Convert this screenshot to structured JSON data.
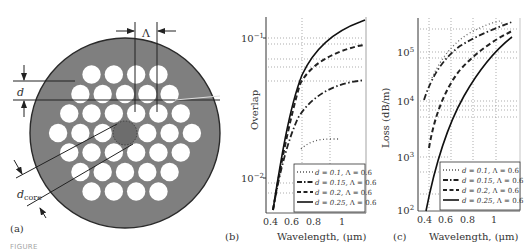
{
  "figure": {
    "panels": [
      {
        "id": "a",
        "label": "(a)",
        "type": "diagram",
        "annotations": {
          "pitch": "Λ",
          "hole_diameter": "d",
          "core_diameter_main": "d",
          "core_diameter_sub": "core"
        },
        "lattice_rows": [
          4,
          5,
          6,
          7,
          6,
          5,
          4
        ]
      },
      {
        "id": "b",
        "label": "(b)",
        "xlabel": "Wavelength, (μm)",
        "ylabel": "Overlap",
        "yticks": [
          "10",
          "10"
        ],
        "yticks_exp": [
          "−1",
          "−2"
        ],
        "xticks": [
          "0.4",
          "0.6",
          "0.8",
          "1"
        ]
      },
      {
        "id": "c",
        "label": "(c)",
        "xlabel": "Wavelength, (μm)",
        "ylabel": "Loss (dB/m)",
        "yticks": [
          "10",
          "10",
          "10",
          "10"
        ],
        "yticks_exp": [
          "5",
          "4",
          "3",
          "2"
        ],
        "xticks": [
          "0.4",
          "0.6",
          "0.8",
          "1"
        ]
      }
    ],
    "legend": [
      {
        "d": "d = 0.1,",
        "lambda": "Λ = 0.6",
        "style": "dotted"
      },
      {
        "d": "d = 0.15,",
        "lambda": "Λ = 0.6",
        "style": "dash-dot"
      },
      {
        "d": "d = 0.2,",
        "lambda": "Λ = 0.6",
        "style": "dashed"
      },
      {
        "d": "d = 0.25,",
        "lambda": "Λ = 0.6",
        "style": "solid"
      }
    ],
    "caption_visible": "FIGURE"
  },
  "chart_data": [
    {
      "type": "line",
      "panel": "b",
      "title": "",
      "xlabel": "Wavelength, (μm)",
      "ylabel": "Overlap",
      "yscale": "log",
      "xlim": [
        0.33,
        1.18
      ],
      "ylim": [
        0.005,
        0.13
      ],
      "grid": "dotted",
      "legend_position": "lower right",
      "series": [
        {
          "name": "d = 0.1, Λ = 0.6",
          "style": "dotted",
          "x": [
            0.6,
            0.7,
            0.8,
            0.9,
            0.95
          ],
          "y": [
            0.011,
            0.013,
            0.0145,
            0.0152,
            0.0153
          ]
        },
        {
          "name": "d = 0.15, Λ = 0.6",
          "style": "dash-dot",
          "x": [
            0.36,
            0.4,
            0.5,
            0.6,
            0.7,
            0.8,
            0.9,
            1.0,
            1.1
          ],
          "y": [
            0.0055,
            0.008,
            0.016,
            0.026,
            0.035,
            0.042,
            0.047,
            0.05,
            0.051
          ]
        },
        {
          "name": "d = 0.2, Λ = 0.6",
          "style": "dashed",
          "x": [
            0.36,
            0.4,
            0.5,
            0.6,
            0.7,
            0.8,
            0.9,
            1.0,
            1.1
          ],
          "y": [
            0.0055,
            0.008,
            0.018,
            0.033,
            0.048,
            0.06,
            0.068,
            0.073,
            0.076
          ]
        },
        {
          "name": "d = 0.25, Λ = 0.6",
          "style": "solid",
          "x": [
            0.36,
            0.4,
            0.5,
            0.6,
            0.7,
            0.8,
            0.9,
            1.0,
            1.1
          ],
          "y": [
            0.0055,
            0.008,
            0.019,
            0.038,
            0.06,
            0.08,
            0.096,
            0.108,
            0.116
          ]
        }
      ]
    },
    {
      "type": "line",
      "panel": "c",
      "title": "",
      "xlabel": "Wavelength, (μm)",
      "ylabel": "Loss (dB/m)",
      "yscale": "log",
      "xlim": [
        0.33,
        1.18
      ],
      "ylim": [
        100,
        350000
      ],
      "grid": "dotted",
      "legend_position": "lower right",
      "series": [
        {
          "name": "d = 0.1, Λ = 0.6",
          "style": "dotted",
          "x": [
            0.45,
            0.55,
            0.65,
            0.8,
            0.95,
            1.0
          ],
          "y": [
            30000,
            90000,
            150000,
            220000,
            300000,
            310000
          ]
        },
        {
          "name": "d = 0.15, Λ = 0.6",
          "style": "dash-dot",
          "x": [
            0.38,
            0.45,
            0.55,
            0.65,
            0.8,
            0.95,
            1.1
          ],
          "y": [
            10000,
            30000,
            70000,
            110000,
            170000,
            230000,
            300000
          ]
        },
        {
          "name": "d = 0.2, Λ = 0.6",
          "style": "dashed",
          "x": [
            0.38,
            0.45,
            0.5,
            0.6,
            0.75,
            0.9,
            1.1
          ],
          "y": [
            1000,
            4000,
            10000,
            30000,
            80000,
            140000,
            230000
          ]
        },
        {
          "name": "d = 0.25, Λ = 0.6",
          "style": "solid",
          "x": [
            0.4,
            0.5,
            0.6,
            0.7,
            0.8,
            0.9,
            1.0,
            1.1
          ],
          "y": [
            100,
            1200,
            8000,
            25000,
            55000,
            100000,
            150000,
            200000
          ]
        }
      ]
    }
  ]
}
